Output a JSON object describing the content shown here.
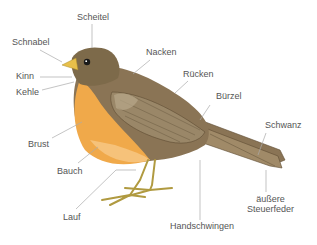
{
  "diagram": {
    "colors": {
      "head": "#7d6a4a",
      "back": "#8a7455",
      "breast": "#f0a94a",
      "belly": "#f6c27a",
      "wing": "#9a8768",
      "beak": "#e8c04a",
      "legs": "#c9b45a",
      "leader_line": "#aaaaaa",
      "label_text": "#555555"
    },
    "labels": [
      {
        "id": "scheitel",
        "text": "Scheitel"
      },
      {
        "id": "schnabel",
        "text": "Schnabel"
      },
      {
        "id": "nacken",
        "text": "Nacken"
      },
      {
        "id": "kinn",
        "text": "Kinn"
      },
      {
        "id": "kehle",
        "text": "Kehle"
      },
      {
        "id": "ruecken",
        "text": "Rücken"
      },
      {
        "id": "buerzel",
        "text": "Bürzel"
      },
      {
        "id": "schwanz",
        "text": "Schwanz"
      },
      {
        "id": "brust",
        "text": "Brust"
      },
      {
        "id": "bauch",
        "text": "Bauch"
      },
      {
        "id": "aeussere_steuerfeder_1",
        "text": "äußere"
      },
      {
        "id": "aeussere_steuerfeder_2",
        "text": "Steuerfeder"
      },
      {
        "id": "lauf",
        "text": "Lauf"
      },
      {
        "id": "handschwingen",
        "text": "Handschwingen"
      }
    ]
  }
}
